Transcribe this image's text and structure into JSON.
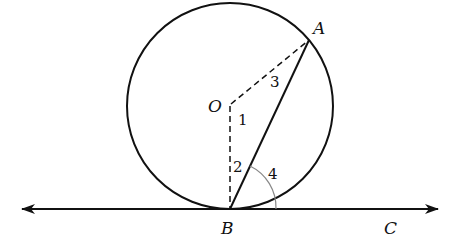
{
  "diagram": {
    "colors": {
      "stroke": "#111111",
      "arc": "#888888",
      "background": "#ffffff"
    },
    "points": {
      "O": {
        "label": "O",
        "x": 230,
        "y": 106
      },
      "A": {
        "label": "A",
        "x": 309,
        "y": 40
      },
      "B": {
        "label": "B",
        "x": 230,
        "y": 209
      },
      "C": {
        "label": "C",
        "x": 392,
        "y": 209
      }
    },
    "circle": {
      "center": "O",
      "radius": 103
    },
    "segments": [
      {
        "from": "O",
        "to": "A",
        "style": "dashed"
      },
      {
        "from": "O",
        "to": "B",
        "style": "dashed"
      },
      {
        "from": "A",
        "to": "B",
        "style": "solid"
      }
    ],
    "tangent_line": {
      "through": [
        "B",
        "C"
      ],
      "arrows": "both"
    },
    "angle_labels": [
      {
        "label": "1",
        "at": "O"
      },
      {
        "label": "2",
        "at": "B"
      },
      {
        "label": "3",
        "at": "A"
      },
      {
        "label": "4",
        "at": "B"
      }
    ]
  }
}
